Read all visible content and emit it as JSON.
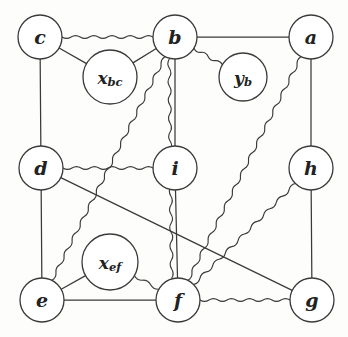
{
  "diagram": {
    "type": "graph",
    "background_color": "#fdfdfc",
    "line_color": "#3a3a3a",
    "node_fill": "#ffffff",
    "nodes": [
      {
        "id": "c",
        "label": "c",
        "sub": "",
        "x": 40,
        "y": 37,
        "r": 22,
        "kind": "variable"
      },
      {
        "id": "b",
        "label": "b",
        "sub": "",
        "x": 175,
        "y": 37,
        "r": 22,
        "kind": "variable"
      },
      {
        "id": "a",
        "label": "a",
        "sub": "",
        "x": 311,
        "y": 37,
        "r": 22,
        "kind": "variable"
      },
      {
        "id": "xbc",
        "label": "x",
        "sub": "bc",
        "x": 110,
        "y": 77,
        "r": 27,
        "kind": "factor"
      },
      {
        "id": "yb",
        "label": "y",
        "sub": "b",
        "x": 243,
        "y": 77,
        "r": 24,
        "kind": "factor"
      },
      {
        "id": "d",
        "label": "d",
        "sub": "",
        "x": 41,
        "y": 168,
        "r": 22,
        "kind": "variable"
      },
      {
        "id": "i",
        "label": "i",
        "sub": "",
        "x": 175,
        "y": 168,
        "r": 22,
        "kind": "variable"
      },
      {
        "id": "h",
        "label": "h",
        "sub": "",
        "x": 311,
        "y": 168,
        "r": 22,
        "kind": "variable"
      },
      {
        "id": "xef",
        "label": "x",
        "sub": "ef",
        "x": 110,
        "y": 262,
        "r": 28,
        "kind": "factor"
      },
      {
        "id": "e",
        "label": "e",
        "sub": "",
        "x": 42,
        "y": 300,
        "r": 22,
        "kind": "variable"
      },
      {
        "id": "f",
        "label": "f",
        "sub": "",
        "x": 178,
        "y": 300,
        "r": 22,
        "kind": "variable"
      },
      {
        "id": "g",
        "label": "g",
        "sub": "",
        "x": 312,
        "y": 300,
        "r": 22,
        "kind": "variable"
      }
    ],
    "edges": [
      {
        "from": "c",
        "to": "b",
        "style": "wavy"
      },
      {
        "from": "b",
        "to": "a",
        "style": "straight"
      },
      {
        "from": "c",
        "to": "xbc",
        "style": "straight"
      },
      {
        "from": "xbc",
        "to": "b",
        "style": "straight"
      },
      {
        "from": "b",
        "to": "yb",
        "style": "wavy"
      },
      {
        "from": "c",
        "to": "d",
        "style": "straight"
      },
      {
        "from": "a",
        "to": "h",
        "style": "straight"
      },
      {
        "from": "b",
        "to": "i",
        "style": "straight"
      },
      {
        "from": "d",
        "to": "i",
        "style": "wavy"
      },
      {
        "from": "d",
        "to": "e",
        "style": "straight"
      },
      {
        "from": "h",
        "to": "g",
        "style": "straight"
      },
      {
        "from": "i",
        "to": "f",
        "style": "straight"
      },
      {
        "from": "e",
        "to": "xef",
        "style": "straight"
      },
      {
        "from": "xef",
        "to": "f",
        "style": "wavy"
      },
      {
        "from": "e",
        "to": "f",
        "style": "straight"
      },
      {
        "from": "f",
        "to": "g",
        "style": "wavy"
      },
      {
        "from": "d",
        "to": "g",
        "style": "straight"
      },
      {
        "from": "b",
        "to": "f",
        "style": "wavy",
        "offset": 6
      },
      {
        "from": "e",
        "to": "b",
        "style": "wavy"
      },
      {
        "from": "a",
        "to": "f",
        "style": "wavy"
      },
      {
        "from": "h",
        "to": "f",
        "style": "wavy"
      }
    ]
  }
}
